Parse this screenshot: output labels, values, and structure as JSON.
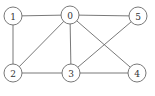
{
  "diagram": {
    "type": "undirected-graph",
    "nodes": [
      {
        "id": "0",
        "label": "0",
        "x": 70,
        "y": 15
      },
      {
        "id": "1",
        "label": "1",
        "x": 13,
        "y": 16
      },
      {
        "id": "2",
        "label": "2",
        "x": 13,
        "y": 73
      },
      {
        "id": "3",
        "label": "3",
        "x": 71,
        "y": 73
      },
      {
        "id": "4",
        "label": "4",
        "x": 137,
        "y": 73
      },
      {
        "id": "5",
        "label": "5",
        "x": 138,
        "y": 16
      }
    ],
    "edges": [
      [
        "1",
        "0"
      ],
      [
        "0",
        "5"
      ],
      [
        "1",
        "2"
      ],
      [
        "0",
        "2"
      ],
      [
        "0",
        "3"
      ],
      [
        "0",
        "4"
      ],
      [
        "5",
        "3"
      ],
      [
        "2",
        "3"
      ],
      [
        "3",
        "4"
      ]
    ],
    "node_radius": 9,
    "colors": {
      "stroke": "#6a6a6a",
      "label": "#333333",
      "background": "#ffffff"
    }
  }
}
